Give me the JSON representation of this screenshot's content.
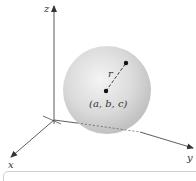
{
  "figure": {
    "type": "3d-sphere-diagram",
    "axes": {
      "x_label": "x",
      "y_label": "y",
      "z_label": "z"
    },
    "sphere": {
      "center_label": "(a, b, c)",
      "radius_label": "r",
      "fill_color": "#d4d4d4",
      "highlight_color": "#f2f2f2",
      "shadow_color": "#b5b5b5"
    },
    "colors": {
      "axis": "#333333",
      "point": "#111111",
      "caption_border": "#cfcfcf"
    }
  }
}
